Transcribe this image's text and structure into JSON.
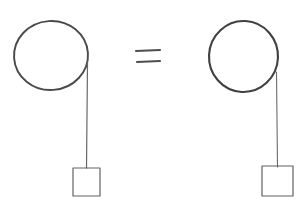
{
  "canvas": {
    "width": 302,
    "height": 211,
    "background_color": "#ffffff",
    "title": "Pulley Equivalence Sketch",
    "style": "hand-drawn pencil line art"
  },
  "palette": {
    "ink_dark": "#454545",
    "ink_medium": "#5a5a5a",
    "ink_light": "#6e6e6e",
    "background": "#ffffff"
  },
  "relation": {
    "symbol_name": "equals-sign",
    "symbol_text": "=",
    "center_x": 148,
    "center_y": 56,
    "bar_top": {
      "x1": 136,
      "y1": 51,
      "x2": 160,
      "y2": 50
    },
    "bar_bottom": {
      "x1": 137,
      "y1": 62,
      "x2": 160,
      "y2": 61
    },
    "stroke_width": 2.1,
    "color": "#4e4e4e"
  },
  "systems": [
    {
      "id": "left-system",
      "label": "left-pulley-system",
      "pulley": {
        "name": "pulley-wheel",
        "center_x": 51,
        "center_y": 55.5,
        "radius_x": 37,
        "radius_y": 34.5,
        "rotation_deg": -4,
        "stroke_width": 1.9,
        "color": "#4a4a4a"
      },
      "rope": {
        "name": "rope-segment",
        "x1": 87.5,
        "y1": 62,
        "x2": 86.5,
        "y2": 168,
        "stroke_width": 1.2,
        "color": "#676767"
      },
      "mass": {
        "name": "hanging-mass-block",
        "x": 73,
        "y": 168,
        "width": 27,
        "height": 28,
        "stroke_width": 1.2,
        "color": "#636363"
      }
    },
    {
      "id": "right-system",
      "label": "right-pulley-system",
      "pulley": {
        "name": "pulley-wheel",
        "center_x": 243.5,
        "center_y": 56.5,
        "radius_x": 34.5,
        "radius_y": 35.5,
        "rotation_deg": 3,
        "stroke_width": 2.1,
        "color": "#414141"
      },
      "rope": {
        "name": "rope-segment",
        "x1": 276.5,
        "y1": 72,
        "x2": 277.5,
        "y2": 167,
        "stroke_width": 1.1,
        "color": "#6a6a6a"
      },
      "mass": {
        "name": "hanging-mass-block",
        "x": 262,
        "y": 166,
        "width": 31,
        "height": 30,
        "stroke_width": 1.2,
        "color": "#606060"
      }
    }
  ]
}
